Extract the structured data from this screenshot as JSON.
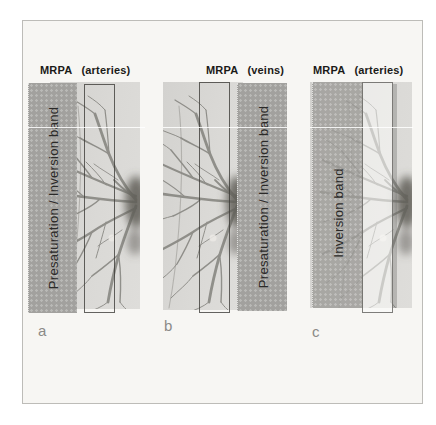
{
  "figure": {
    "panels": [
      {
        "letter": "a",
        "title": "MRPA",
        "subtitle": "(arteries)",
        "band_label": "Presaturation / Inversion band",
        "band_side": "left"
      },
      {
        "letter": "b",
        "title": "MRPA",
        "subtitle": "(veins)",
        "band_label": "Presaturation / Inversion band",
        "band_side": "right"
      },
      {
        "letter": "c",
        "title": "MRPA",
        "subtitle": "(arteries)",
        "band_label": "Inversion band",
        "band_side": "left"
      }
    ],
    "colors": {
      "page_background": "#f7f6f3",
      "frame_line": "#bdbcb8",
      "angiogram_background": "#d8d7d4",
      "band_gray": "#a2a19e",
      "vessel_gray": "#5f5e58",
      "header_text": "#1b1a18",
      "band_text": "#2b2a28",
      "panel_letter": "#8b8a87"
    }
  }
}
